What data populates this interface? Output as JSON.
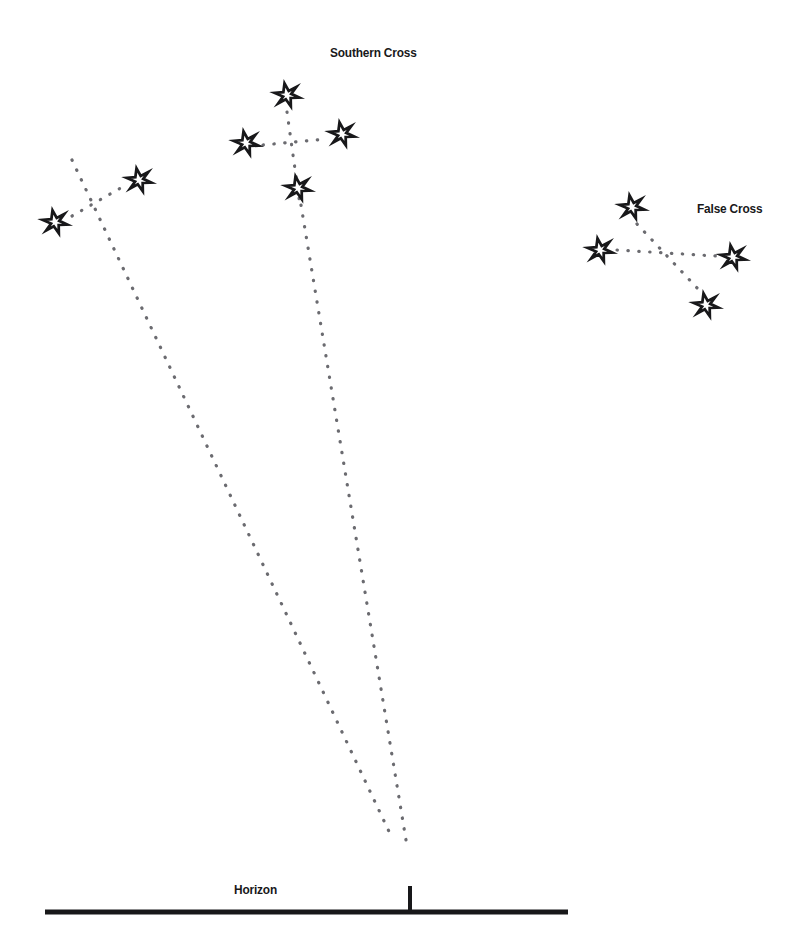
{
  "diagram": {
    "title_visible": false,
    "background_color": "#ffffff",
    "ink_color": "#18181a",
    "dot_color": "#6b6b70",
    "width": 811,
    "height": 931
  },
  "labels": {
    "southern_cross": "Southern Cross",
    "false_cross": "False Cross",
    "horizon": "Horizon"
  },
  "chart_data": {
    "type": "scatter",
    "xlabel": "",
    "ylabel": "",
    "xlim": [
      0,
      811
    ],
    "ylim": [
      0,
      931
    ],
    "grid": false,
    "legend": null,
    "annotations": [
      {
        "text": "Southern Cross",
        "x": 330,
        "y": 52
      },
      {
        "text": "False Cross",
        "x": 697,
        "y": 208
      },
      {
        "text": "Horizon",
        "x": 234,
        "y": 889
      }
    ],
    "series": [
      {
        "name": "Southern Cross",
        "marker": "six-pointed-star",
        "points": [
          {
            "label": "top",
            "x": 287,
            "y": 95,
            "size": 23
          },
          {
            "label": "left",
            "x": 246,
            "y": 143,
            "size": 23
          },
          {
            "label": "right",
            "x": 342,
            "y": 134,
            "size": 23
          },
          {
            "label": "bottom",
            "x": 298,
            "y": 188,
            "size": 23
          }
        ]
      },
      {
        "name": "Pointers",
        "marker": "six-pointed-star",
        "points": [
          {
            "label": "near-pointer",
            "x": 139,
            "y": 180,
            "size": 23
          },
          {
            "label": "far-pointer",
            "x": 55,
            "y": 222,
            "size": 23
          }
        ]
      },
      {
        "name": "False Cross",
        "marker": "six-pointed-star",
        "points": [
          {
            "label": "top",
            "x": 632,
            "y": 207,
            "size": 23
          },
          {
            "label": "left",
            "x": 600,
            "y": 250,
            "size": 23
          },
          {
            "label": "right",
            "x": 733,
            "y": 257,
            "size": 23
          },
          {
            "label": "bottom",
            "x": 706,
            "y": 305,
            "size": 23
          }
        ]
      }
    ],
    "dotted_lines": [
      {
        "name": "southern-cross-vertical",
        "from": [
          287,
          112
        ],
        "to": [
          300,
          205
        ]
      },
      {
        "name": "southern-cross-horizontal",
        "from": [
          263,
          145
        ],
        "to": [
          327,
          139
        ]
      },
      {
        "name": "pointers-link",
        "from": [
          72,
          216
        ],
        "to": [
          124,
          186
        ]
      },
      {
        "name": "pointer-long-line",
        "from": [
          72,
          160
        ],
        "to": [
          393,
          840
        ]
      },
      {
        "name": "southern-cross-long-line",
        "from": [
          301,
          205
        ],
        "to": [
          406,
          840
        ]
      },
      {
        "name": "false-cross-horizontal",
        "from": [
          617,
          250
        ],
        "to": [
          716,
          256
        ]
      },
      {
        "name": "false-cross-diagonal",
        "from": [
          637,
          224
        ],
        "to": [
          699,
          290
        ]
      }
    ],
    "horizon": {
      "y": 912,
      "x_start": 45,
      "x_end": 568,
      "thickness": 5,
      "tick": {
        "x": 410,
        "top": 886,
        "bottom": 912,
        "thickness": 4
      }
    }
  }
}
